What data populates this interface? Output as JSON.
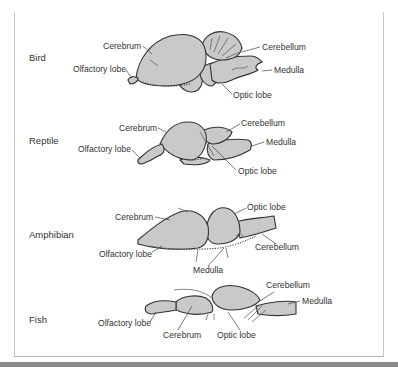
{
  "figure": {
    "rows": [
      {
        "animal": "Bird",
        "labels": {
          "cerebrum": "Cerebrum",
          "cerebellum": "Cerebellum",
          "olfactory_lobe": "Olfactory lobe",
          "medulla": "Medulla",
          "optic_lobe": "Optic lobe"
        }
      },
      {
        "animal": "Reptile",
        "labels": {
          "cerebrum": "Cerebrum",
          "cerebellum": "Cerebellum",
          "olfactory_lobe": "Olfactory lobe",
          "medulla": "Medulla",
          "optic_lobe": "Optic lobe"
        }
      },
      {
        "animal": "Amphibian",
        "labels": {
          "cerebrum": "Cerebrum",
          "optic_lobe": "Optic lobe",
          "olfactory_lobe": "Olfactory lobe",
          "cerebellum": "Cerebellum",
          "medulla": "Medulla"
        }
      },
      {
        "animal": "Fish",
        "labels": {
          "cerebellum": "Cerebellum",
          "medulla": "Medulla",
          "olfactory_lobe": "Olfactory lobe",
          "cerebrum": "Cerebrum",
          "optic_lobe": "Optic lobe"
        }
      }
    ],
    "colors": {
      "brain_fill": "#c9c9c9",
      "outline": "#333333",
      "frame": "#c8c8c8",
      "bottom_bar": "#8a8a8a"
    }
  }
}
